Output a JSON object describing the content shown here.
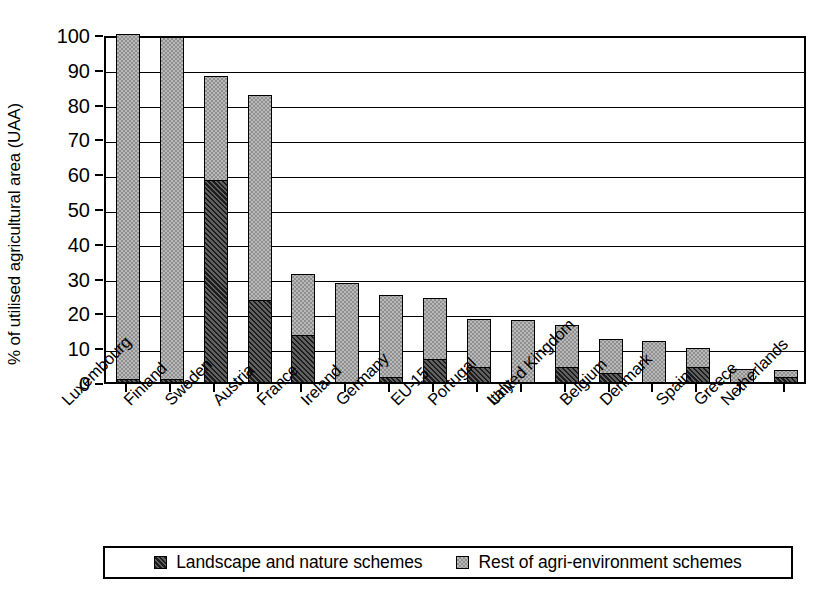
{
  "chart": {
    "type": "bar",
    "ylabel": "% of utilised agricultural area (UAA)",
    "title": "",
    "xlabel": ""
  },
  "legend": {
    "position": "bottom",
    "items": [
      {
        "label": "Landscape and nature schemes",
        "key": "landscape",
        "swatch": "dark-hatch-swatch"
      },
      {
        "label": "Rest of agri-environment schemes",
        "key": "rest",
        "swatch": "light-check-swatch"
      }
    ]
  },
  "yaxis": {
    "min": 0,
    "max": 100,
    "step": 10,
    "ticks": [
      "0",
      "10",
      "20",
      "30",
      "40",
      "50",
      "60",
      "70",
      "80",
      "90",
      "100"
    ]
  },
  "chart_data": {
    "type": "bar",
    "stacked": true,
    "title": "",
    "xlabel": "",
    "ylabel": "% of utilised agricultural area (UAA)",
    "ylim": [
      0,
      100
    ],
    "grid": true,
    "legend_position": "bottom",
    "categories": [
      "Luxembourg",
      "Finland",
      "Sweden",
      "Austria",
      "France",
      "Ireland",
      "Germany",
      "EU-15",
      "Portugal",
      "Italy",
      "United Kingdom",
      "Belgium",
      "Denmark",
      "Spain",
      "Greece",
      "Netherlands"
    ],
    "series": [
      {
        "name": "Landscape and nature schemes",
        "values": [
          1.0,
          1.0,
          58.0,
          23.5,
          13.5,
          0.0,
          1.5,
          6.5,
          4.3,
          0.0,
          4.3,
          2.7,
          0.0,
          4.3,
          0.0,
          1.5
        ]
      },
      {
        "name": "Rest of agri-environment schemes",
        "values": [
          99.0,
          98.0,
          30.0,
          59.0,
          17.5,
          28.5,
          23.5,
          17.5,
          13.7,
          17.8,
          12.2,
          9.6,
          11.8,
          5.4,
          3.7,
          2.0
        ]
      }
    ],
    "totals": [
      100.0,
      99.0,
      88.0,
      82.5,
      31.0,
      28.5,
      25.0,
      24.0,
      18.0,
      17.8,
      16.5,
      12.3,
      11.8,
      9.7,
      3.7,
      3.5
    ]
  }
}
